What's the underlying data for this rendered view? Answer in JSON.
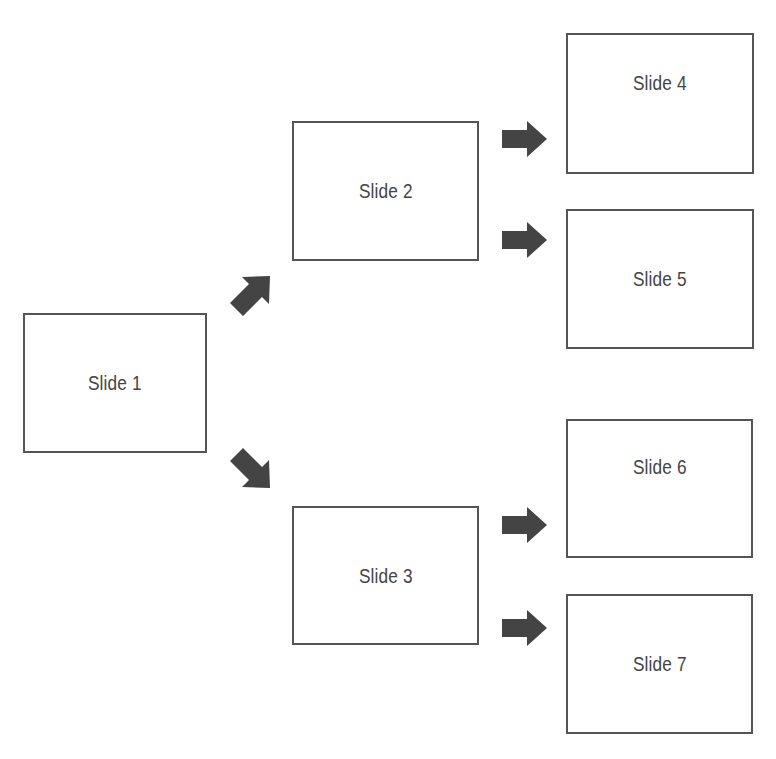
{
  "header": {
    "cropped_text": "a    g    p"
  },
  "diagram": {
    "type": "slide-navigation-tree",
    "arrow_color": "#444444",
    "border_color": "#555555",
    "slides": [
      {
        "id": "slide1",
        "label": "Slide 1"
      },
      {
        "id": "slide2",
        "label": "Slide 2"
      },
      {
        "id": "slide3",
        "label": "Slide 3"
      },
      {
        "id": "slide4",
        "label": "Slide 4"
      },
      {
        "id": "slide5",
        "label": "Slide 5"
      },
      {
        "id": "slide6",
        "label": "Slide 6"
      },
      {
        "id": "slide7",
        "label": "Slide 7"
      }
    ],
    "edges": [
      {
        "from": "Slide 1",
        "to": "Slide 2",
        "arrow": "up-right"
      },
      {
        "from": "Slide 1",
        "to": "Slide 3",
        "arrow": "down-right"
      },
      {
        "from": "Slide 2",
        "to": "Slide 4",
        "arrow": "right"
      },
      {
        "from": "Slide 2",
        "to": "Slide 5",
        "arrow": "right"
      },
      {
        "from": "Slide 3",
        "to": "Slide 6",
        "arrow": "right"
      },
      {
        "from": "Slide 3",
        "to": "Slide 7",
        "arrow": "right"
      }
    ]
  }
}
